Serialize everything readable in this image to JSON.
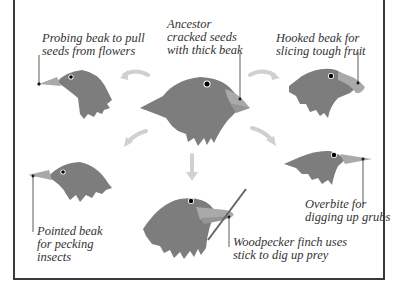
{
  "diagram": {
    "colors": {
      "head": "#7d7d7d",
      "beak": "#a9a9a9",
      "beak_dark": "#959595",
      "arrow": "#d0d0d0",
      "leader": "#333333",
      "border": "#3a3a3a",
      "text": "#333333"
    },
    "labels": {
      "ancestor": [
        "Ancestor",
        "cracked seeds",
        "with thick beak"
      ],
      "probing": [
        "Probing beak to pull",
        "seeds from flowers"
      ],
      "hooked": [
        "Hooked beak for",
        "slicing tough fruit"
      ],
      "pointed": [
        "Pointed beak",
        "for pecking",
        "insects"
      ],
      "overbite": [
        "Overbite for",
        "digging up grubs"
      ],
      "woodpecker": [
        "Woodpecker finch uses",
        "stick to dig up prey"
      ]
    }
  }
}
